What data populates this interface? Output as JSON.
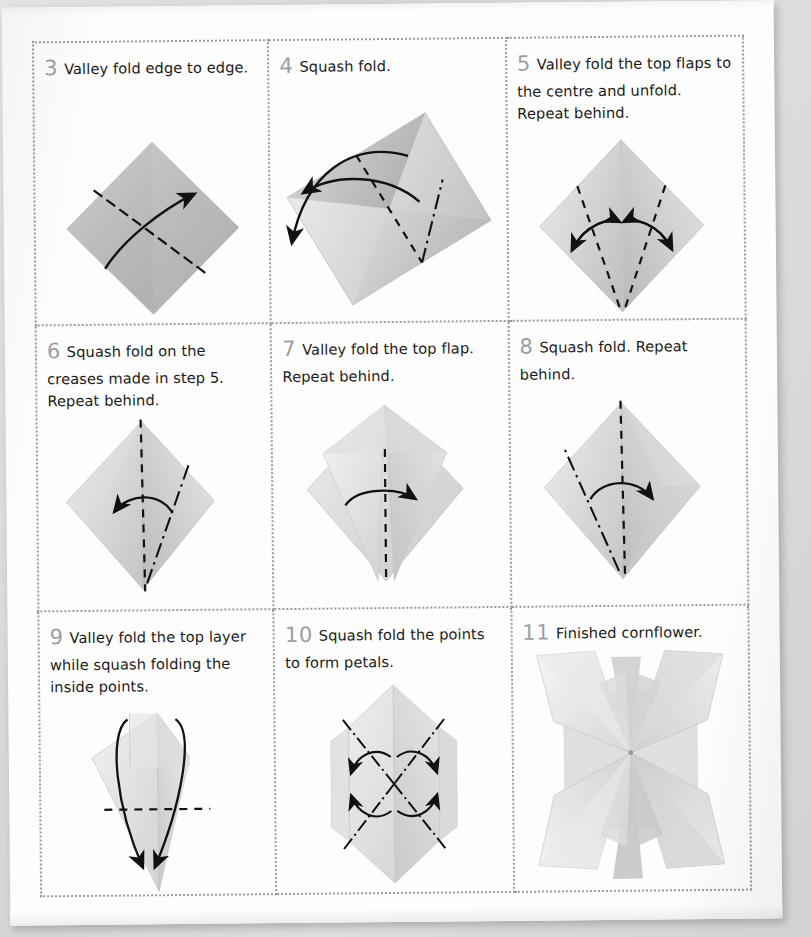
{
  "page": {
    "background_color": "#d9d9d7",
    "sheet_color": "#fdfdfd",
    "grid_border_color": "#9a9a9a",
    "step_number_color": "#9d9d9d",
    "paper_fill_light": "#f2f2f2",
    "paper_fill_mid": "#d9d9d9",
    "paper_fill_dark": "#bcbcbc",
    "crease_color": "#111111"
  },
  "steps": [
    {
      "number": "3",
      "text": "Valley fold edge to edge.",
      "diagram": "square-diamond-with-diagonal-valley-fold",
      "fold_types": [
        "valley"
      ],
      "arrows": 1
    },
    {
      "number": "4",
      "text": "Squash fold.",
      "diagram": "tilted-rectangle-squash-fold",
      "fold_types": [
        "valley",
        "mountain"
      ],
      "arrows": 2
    },
    {
      "number": "5",
      "text": "Valley fold the top flaps to the centre and unfold. Repeat behind.",
      "diagram": "diamond-two-valley-folds-to-centre",
      "fold_types": [
        "valley"
      ],
      "arrows": 2
    },
    {
      "number": "6",
      "text": "Squash fold on the creases made in step 5. Repeat behind.",
      "diagram": "diamond-squash-fold-left",
      "fold_types": [
        "valley",
        "mountain"
      ],
      "arrows": 1
    },
    {
      "number": "7",
      "text": "Valley fold the top flap. Repeat behind.",
      "diagram": "kite-valley-fold-top-flap",
      "fold_types": [
        "valley"
      ],
      "arrows": 1
    },
    {
      "number": "8",
      "text": "Squash fold. Repeat behind.",
      "diagram": "diamond-squash-fold-right",
      "fold_types": [
        "valley",
        "mountain"
      ],
      "arrows": 1
    },
    {
      "number": "9",
      "text": "Valley fold the top layer while squash folding the inside points.",
      "diagram": "narrow-kite-horizontal-valley-fold",
      "fold_types": [
        "valley"
      ],
      "arrows": 2
    },
    {
      "number": "10",
      "text": "Squash fold the points to form petals.",
      "diagram": "hexagon-four-mountain-folds",
      "fold_types": [
        "mountain"
      ],
      "arrows": 4
    },
    {
      "number": "11",
      "text": "Finished cornflower.",
      "diagram": "finished-cornflower-four-petals",
      "fold_types": [],
      "arrows": 0
    }
  ]
}
